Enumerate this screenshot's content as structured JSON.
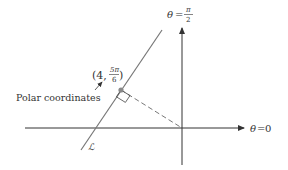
{
  "diagram": {
    "axes": {
      "vertical_label": {
        "lhs": "θ",
        "eq": "=",
        "num": "π",
        "den": "2"
      },
      "horizontal_label": {
        "lhs": "θ",
        "eq": "=",
        "rhs": "0"
      }
    },
    "point": {
      "label_open": "(4,",
      "num": "5π",
      "den": "6",
      "label_close": ")",
      "r": 4,
      "theta": "5π/6"
    },
    "callout": "Polar coordinates",
    "line_label": "ℒ",
    "colors": {
      "line": "#777777",
      "axis": "#333333",
      "point": "#888888",
      "text": "#333333"
    }
  }
}
